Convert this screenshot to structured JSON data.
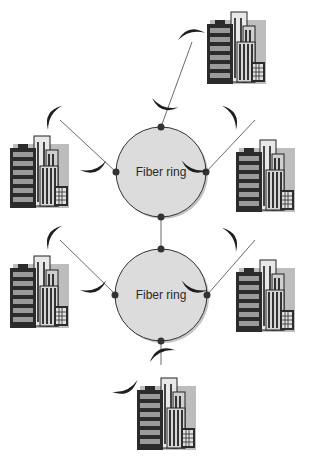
{
  "diagram": {
    "type": "network-topology",
    "rings": [
      {
        "label": "Fiber ring",
        "cx": 161,
        "cy": 172,
        "r": 45
      },
      {
        "label": "Fiber ring",
        "cx": 161,
        "cy": 295,
        "r": 46
      }
    ],
    "nodes": [
      {
        "id": "top-right-building"
      },
      {
        "id": "upper-left-building"
      },
      {
        "id": "upper-right-building"
      },
      {
        "id": "lower-left-building"
      },
      {
        "id": "lower-right-building"
      },
      {
        "id": "bottom-building"
      }
    ],
    "link_type": "microwave-dish",
    "colors": {
      "ring_fill": "#dcdcdc",
      "ring_stroke": "#333333",
      "node_dot": "#333333",
      "building_dark": "#2b2b2b",
      "building_light": "#e6e6e6",
      "dish": "#1f1f1f"
    }
  }
}
